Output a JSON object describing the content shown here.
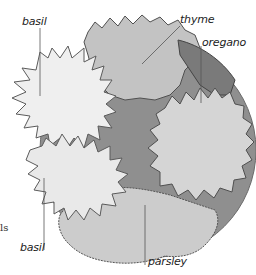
{
  "diagram": {
    "type": "planting-plan",
    "colors": {
      "pot_fill": "#8a8a8a",
      "pot_rim": "#6e6e6e",
      "thyme_fill": "#c6c6c6",
      "oregano_fill": "#d8d8d8",
      "basil_fill": "#ececec",
      "parsley_fill": "#cfcfcf",
      "outline": "#5a5a5a",
      "leader": "#555555"
    },
    "labels": [
      {
        "id": "basil-top",
        "text": "basil"
      },
      {
        "id": "thyme",
        "text": "thyme"
      },
      {
        "id": "oregano",
        "text": "oregano"
      },
      {
        "id": "basil-bottom",
        "text": "basil"
      },
      {
        "id": "parsley",
        "text": "parsley"
      }
    ],
    "edge_fragment": "ls"
  }
}
